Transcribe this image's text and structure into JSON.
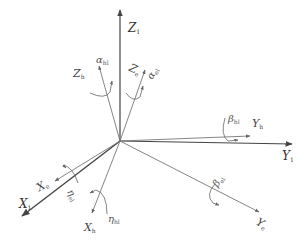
{
  "diagram": {
    "type": "coordinate-frame",
    "origin": [
      120,
      141
    ],
    "axes": [
      {
        "id": "Z1",
        "label": "Z",
        "sub": "1",
        "pos": [
          128,
          22
        ]
      },
      {
        "id": "Y1",
        "label": "Y",
        "sub": "1",
        "pos": [
          282,
          150
        ]
      },
      {
        "id": "X1",
        "label": "X",
        "sub": "1",
        "pos": [
          19,
          198
        ]
      },
      {
        "id": "Zh",
        "label": "Z",
        "sub": "h",
        "pos": [
          73,
          68
        ]
      },
      {
        "id": "Ze",
        "label": "Z",
        "sub": "e",
        "pos": [
          129,
          64
        ]
      },
      {
        "id": "Yh",
        "label": "Y",
        "sub": "h",
        "pos": [
          252,
          118
        ]
      },
      {
        "id": "Ye",
        "label": "Y",
        "sub": "e",
        "pos": [
          256,
          221
        ]
      },
      {
        "id": "Xe",
        "label": "X",
        "sub": "e",
        "pos": [
          37,
          182
        ]
      },
      {
        "id": "Xh",
        "label": "X",
        "sub": "h",
        "pos": [
          84,
          224
        ]
      }
    ],
    "angles": [
      {
        "id": "alpha_h",
        "label": "α",
        "sub": "hl",
        "pos": [
          96,
          55
        ]
      },
      {
        "id": "alpha_e",
        "label": "α",
        "sub": "el",
        "pos": [
          147,
          66
        ]
      },
      {
        "id": "beta_h",
        "label": "β",
        "sub": "hl",
        "pos": [
          228,
          112
        ]
      },
      {
        "id": "beta_e",
        "label": "β",
        "sub": "el",
        "pos": [
          213,
          175
        ]
      },
      {
        "id": "eta_e",
        "label": "η",
        "sub": "el",
        "pos": [
          68,
          188
        ]
      },
      {
        "id": "eta_h",
        "label": "η",
        "sub": "hl",
        "pos": [
          106,
          213
        ]
      }
    ]
  }
}
